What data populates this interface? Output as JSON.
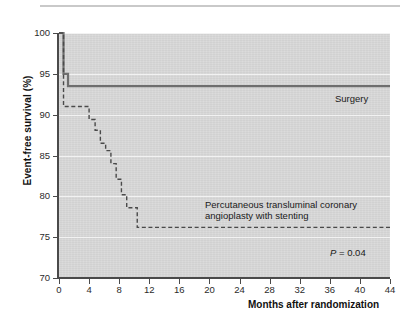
{
  "figure": {
    "has_top_rule": true,
    "background_color": "#ffffff",
    "plot_background_color": "#d8d8d8"
  },
  "axes": {
    "y_title": "Event-free survival (%)",
    "x_title": "Months after randomization",
    "y_ticks": [
      "100",
      "95",
      "90",
      "85",
      "80",
      "75",
      "70"
    ],
    "x_ticks": [
      "0",
      "4",
      "8",
      "12",
      "16",
      "20",
      "24",
      "28",
      "32",
      "36",
      "40",
      "44"
    ]
  },
  "annotations": {
    "surgery": "Surgery",
    "ptca": "Percutaneous transluminal coronary angioplasty with stenting",
    "p_value_symbol": "P",
    "p_value_rest": " = 0.04"
  },
  "chart_data": {
    "type": "line",
    "title": "",
    "subtitle": "",
    "xlabel": "Months after randomization",
    "ylabel": "Event-free survival (%)",
    "xlim": [
      0,
      44
    ],
    "ylim": [
      70,
      100
    ],
    "xticks": [
      0,
      4,
      8,
      12,
      16,
      20,
      24,
      28,
      32,
      36,
      40,
      44
    ],
    "yticks": [
      70,
      75,
      80,
      85,
      90,
      95,
      100
    ],
    "grid": "horizontal",
    "legend": "inline-annotations",
    "step_style": "post",
    "series": [
      {
        "name": "Surgery",
        "style": "solid",
        "color": "#6e6e6e",
        "line_width": 2,
        "x": [
          0,
          0.3,
          0.6,
          1.0,
          1.2,
          44
        ],
        "y": [
          100,
          100,
          95.0,
          95.0,
          93.5,
          93.5
        ]
      },
      {
        "name": "Percutaneous transluminal coronary angioplasty with stenting",
        "style": "dashed",
        "color": "#4a4a4a",
        "line_width": 1.4,
        "x": [
          0,
          0.3,
          0.6,
          3.2,
          4.0,
          4.8,
          5.5,
          6.2,
          6.9,
          7.6,
          8.3,
          9.0,
          9.8,
          10.4,
          44
        ],
        "y": [
          100,
          100,
          91.0,
          91.0,
          89.4,
          88.1,
          86.5,
          85.6,
          84.0,
          82.1,
          80.2,
          78.6,
          78.6,
          76.2,
          76.2
        ]
      }
    ],
    "annotations": [
      {
        "text": "Surgery",
        "x": 38,
        "y": 92.5
      },
      {
        "text": "Percutaneous transluminal coronary angioplasty with stenting",
        "x": 20,
        "y": 79.5
      },
      {
        "text": "P = 0.04",
        "x": 37,
        "y": 73.5
      }
    ]
  }
}
